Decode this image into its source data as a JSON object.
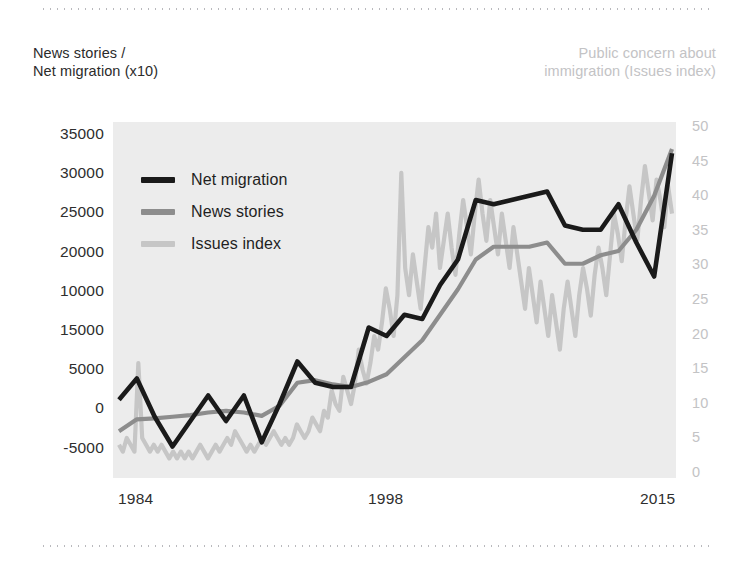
{
  "axis_captions": {
    "left_line1": "News stories /",
    "left_line2": "Net migration (x10)",
    "right_line1": "Public concern about",
    "right_line2": "immigration (Issues index)"
  },
  "colors": {
    "net_migration": "#1a1a1a",
    "news_stories": "#8d8d8d",
    "issues_index": "#c6c6c6",
    "plot_background": "#ececec",
    "left_axis_text": "#2e2e2e",
    "right_axis_text": "#c3c3c5",
    "rule": "#b9b9bd"
  },
  "legend": {
    "items": [
      {
        "label": "Net migration",
        "color": "#1a1a1a"
      },
      {
        "label": "News stories",
        "color": "#8d8d8d"
      },
      {
        "label": "Issues index",
        "color": "#c6c6c6"
      }
    ]
  },
  "chart_data": {
    "type": "line",
    "title": "",
    "subtitle": "",
    "xlabel": "",
    "ylabel": "News stories / Net migration (x10)",
    "y2label": "Public concern about immigration (Issues index)",
    "grid": false,
    "legend_position": "inside-top-left",
    "x_tick_labels": [
      "1984",
      "1998",
      "2015"
    ],
    "x_tick_values": [
      1984,
      1998,
      2015
    ],
    "xlim": [
      1984,
      2015
    ],
    "left_axis_tick_labels": [
      "35000",
      "30000",
      "25000",
      "20000",
      "10000",
      "15000",
      "5000",
      "0",
      "-5000"
    ],
    "left_axis_tick_positions": [
      35000,
      30000,
      25000,
      20000,
      15000,
      10000,
      5000,
      0,
      -5000
    ],
    "ylim": [
      -5000,
      35000
    ],
    "right_axis_tick_labels": [
      "50",
      "45",
      "40",
      "35",
      "30",
      "25",
      "20",
      "15",
      "10",
      "5",
      "0"
    ],
    "y2lim": [
      0,
      50
    ],
    "series": [
      {
        "name": "Net migration",
        "axis": "left",
        "color": "#1a1a1a",
        "x": [
          1984,
          1985,
          1986,
          1987,
          1988,
          1989,
          1990,
          1991,
          1992,
          1993,
          1994,
          1995,
          1996,
          1997,
          1998,
          1999,
          2000,
          2001,
          2002,
          2003,
          2004,
          2005,
          2006,
          2007,
          2008,
          2009,
          2010,
          2011,
          2012,
          2013,
          2014,
          2015
        ],
        "values": [
          3500,
          6000,
          1500,
          -2000,
          1000,
          4000,
          1000,
          4000,
          -1500,
          3000,
          8000,
          5500,
          5000,
          5000,
          12000,
          11000,
          13500,
          13000,
          17000,
          20000,
          27000,
          26500,
          27000,
          27500,
          28000,
          24000,
          23500,
          23500,
          26500,
          22000,
          18000,
          32500
        ]
      },
      {
        "name": "News stories",
        "axis": "left",
        "color": "#8d8d8d",
        "x": [
          1984,
          1985,
          1986,
          1987,
          1988,
          1989,
          1990,
          1991,
          1992,
          1993,
          1994,
          1995,
          1996,
          1997,
          1998,
          1999,
          2000,
          2001,
          2002,
          2003,
          2004,
          2005,
          2006,
          2007,
          2008,
          2009,
          2010,
          2011,
          2012,
          2013,
          2014,
          2015
        ],
        "values": [
          -200,
          1200,
          1300,
          1500,
          1700,
          2000,
          2200,
          2000,
          1600,
          2800,
          5500,
          5800,
          5300,
          5000,
          5600,
          6500,
          8500,
          10500,
          13500,
          16500,
          20000,
          21500,
          21500,
          21500,
          22000,
          19500,
          19500,
          20500,
          21000,
          23500,
          27500,
          33000
        ]
      },
      {
        "name": "Issues index",
        "axis": "right",
        "color": "#c6c6c6",
        "note": "monthly high-frequency series, 1984-2015",
        "values_monthly_approx": [
          4,
          3,
          5,
          4,
          3,
          16,
          5,
          4,
          3,
          4,
          3,
          4,
          3,
          2,
          3,
          2,
          3,
          2,
          3,
          2,
          3,
          4,
          3,
          2,
          3,
          4,
          3,
          4,
          5,
          4,
          6,
          5,
          4,
          3,
          4,
          3,
          4,
          5,
          4,
          5,
          6,
          5,
          4,
          5,
          4,
          5,
          7,
          6,
          5,
          6,
          8,
          7,
          6,
          9,
          8,
          12,
          10,
          9,
          14,
          12,
          10,
          13,
          18,
          15,
          13,
          16,
          20,
          18,
          22,
          27,
          24,
          20,
          26,
          44,
          30,
          26,
          32,
          28,
          24,
          30,
          36,
          33,
          38,
          30,
          34,
          38,
          33,
          29,
          35,
          40,
          36,
          32,
          38,
          43,
          38,
          34,
          40,
          36,
          32,
          38,
          34,
          30,
          36,
          32,
          28,
          24,
          30,
          26,
          22,
          28,
          24,
          20,
          26,
          22,
          18,
          24,
          28,
          24,
          20,
          26,
          30,
          27,
          23,
          29,
          33,
          30,
          26,
          32,
          38,
          35,
          31,
          37,
          42,
          38,
          34,
          40,
          45,
          41,
          37,
          43,
          40,
          36,
          42,
          38
        ]
      }
    ]
  }
}
